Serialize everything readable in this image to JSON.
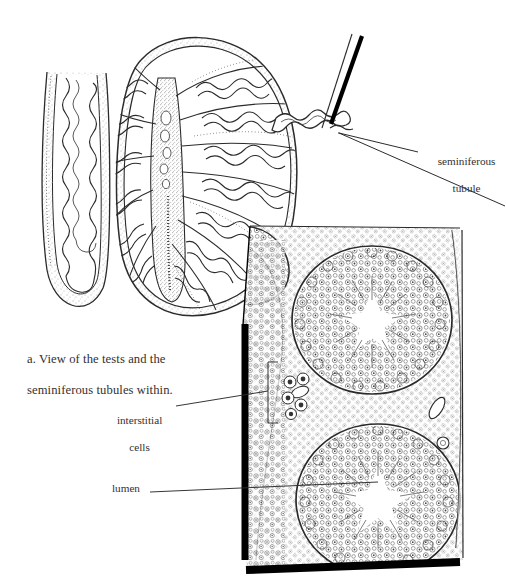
{
  "figure": {
    "background_color": "#ffffff",
    "ink_color": "#2b2b2b",
    "text_color": "#333030",
    "panel_border_color": "#000000"
  },
  "caption": {
    "line1": "a. View of the tests and the",
    "line2": "seminiferous tubules within."
  },
  "labels": {
    "seminiferous_tubule": {
      "line1": "seminiferous",
      "line2": "tubule"
    },
    "interstitial_cells": {
      "line1": "interstitial",
      "line2": "cells"
    },
    "lumen": "lumen"
  },
  "parts": {
    "vas_deferens": "vas-deferens",
    "epididymis": "epididymis",
    "testis": "testis",
    "lobules": "testis-lobules",
    "mediastinum": "mediastinum-testis",
    "efferent_ductules": "efferent-ductules",
    "micrograph_panel": "seminiferous-tubule-micrograph",
    "tubule_cross_section_upper": "tubule-cross-section-upper",
    "tubule_cross_section_lower": "tubule-cross-section-lower",
    "interstitial_cell_cluster": "interstitial-cell-cluster"
  }
}
